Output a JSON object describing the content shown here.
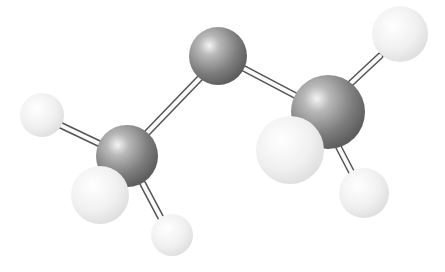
{
  "image": {
    "description": "Ball-and-stick molecular model of dimethyl ether (CH3-O-CH3) rendered in grayscale",
    "width": 445,
    "height": 272,
    "background": "#ffffff"
  },
  "atoms": [
    {
      "id": "h-top-right",
      "element": "H",
      "cx": 400,
      "cy": 34,
      "r": 28,
      "color": "#ececec"
    },
    {
      "id": "h-left",
      "element": "H",
      "cx": 42,
      "cy": 115,
      "r": 22,
      "color": "#ececec"
    },
    {
      "id": "h-right-bottom",
      "element": "H",
      "cx": 364,
      "cy": 193,
      "r": 25,
      "color": "#ececec"
    },
    {
      "id": "h-bottom",
      "element": "H",
      "cx": 172,
      "cy": 235,
      "r": 21,
      "color": "#ececec"
    },
    {
      "id": "central",
      "element": "O",
      "cx": 218,
      "cy": 56,
      "r": 29,
      "color": "#8c8c8c"
    },
    {
      "id": "c-left",
      "element": "C",
      "cx": 127,
      "cy": 156,
      "r": 31,
      "color": "#8a8a8a"
    },
    {
      "id": "c-right",
      "element": "C",
      "cx": 328,
      "cy": 112,
      "r": 37,
      "color": "#8a8a8a"
    },
    {
      "id": "h-left-front",
      "element": "H",
      "cx": 100,
      "cy": 195,
      "r": 29,
      "color": "#ececec"
    },
    {
      "id": "h-right-front",
      "element": "H",
      "cx": 290,
      "cy": 150,
      "r": 34,
      "color": "#ececec"
    }
  ],
  "bonds": [
    {
      "from": "central",
      "to": "c-left",
      "x1": 200,
      "y1": 78,
      "x2": 147,
      "y2": 133
    },
    {
      "from": "central",
      "to": "c-right",
      "x1": 243,
      "y1": 68,
      "x2": 300,
      "y2": 98
    },
    {
      "from": "c-left",
      "to": "h-left",
      "x1": 100,
      "y1": 144,
      "x2": 58,
      "y2": 124
    },
    {
      "from": "c-left",
      "to": "h-bottom",
      "x1": 143,
      "y1": 184,
      "x2": 162,
      "y2": 220
    },
    {
      "from": "c-right",
      "to": "h-top-right",
      "x1": 350,
      "y1": 84,
      "x2": 380,
      "y2": 56
    },
    {
      "from": "c-right",
      "to": "h-right-bottom",
      "x1": 338,
      "y1": 146,
      "x2": 352,
      "y2": 173
    }
  ],
  "labels": []
}
